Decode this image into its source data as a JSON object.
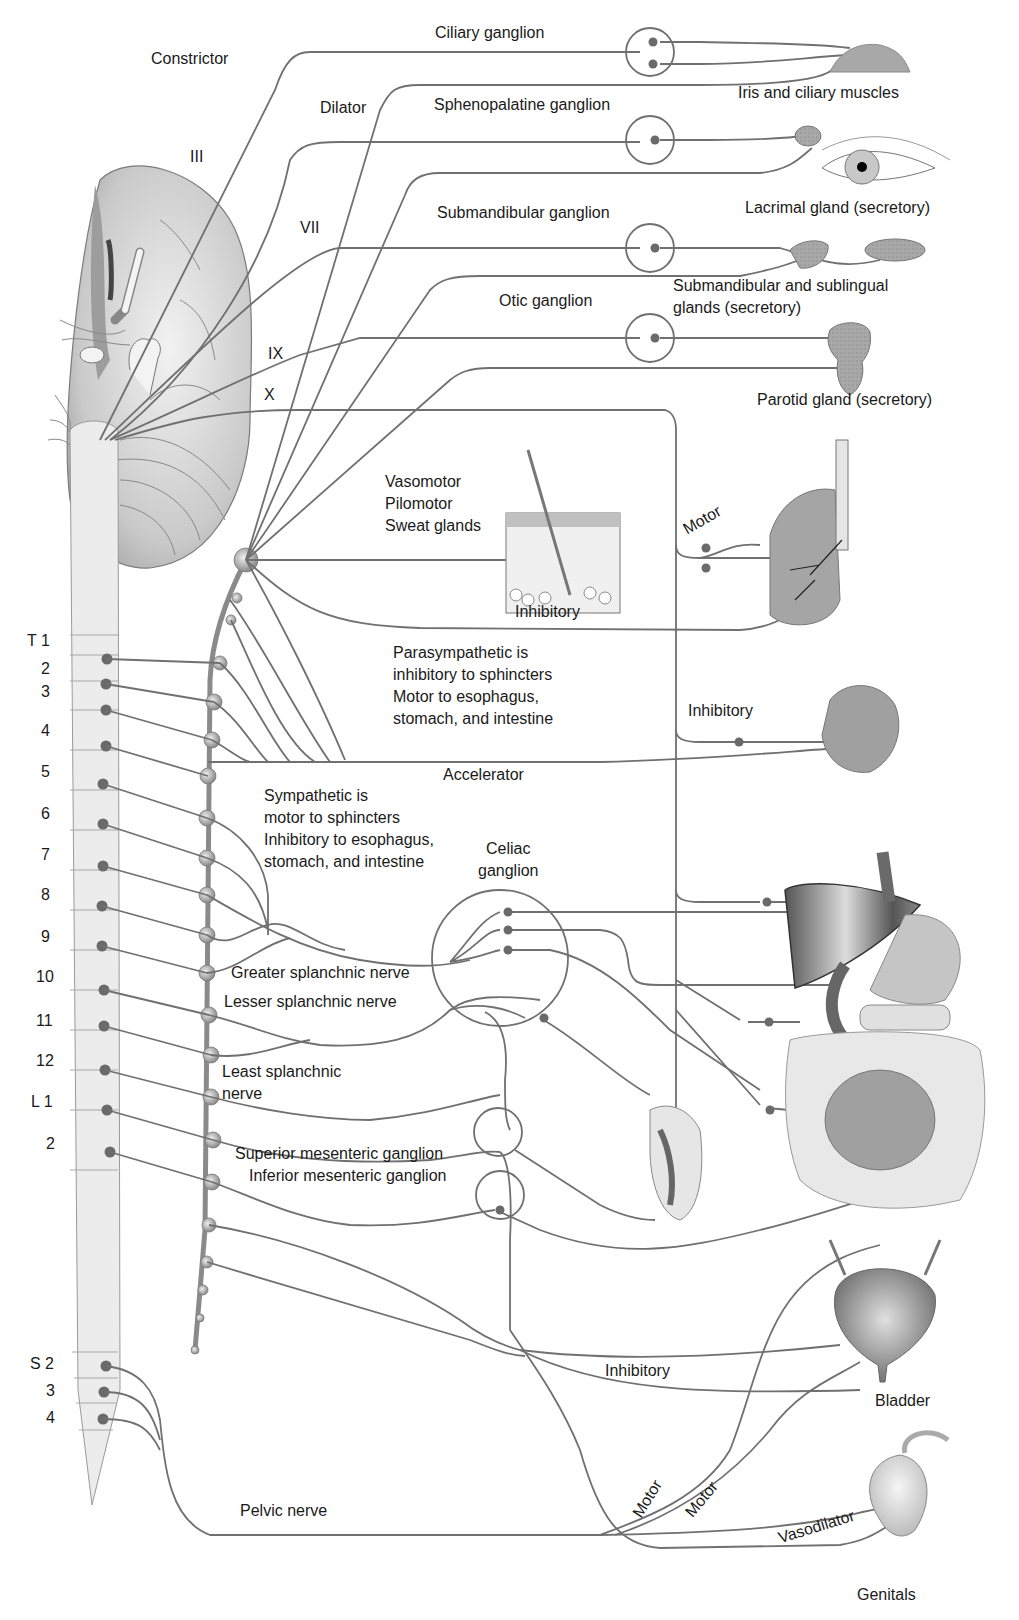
{
  "diagram": {
    "colors": {
      "nerve": "#6e6e6e",
      "ganglion_outline": "#6e6e6e",
      "cell_body": "#666666",
      "cord_fill": "#ececec",
      "organ_fill_light": "#d6d6d6",
      "organ_fill_dark": "#8a8a8a",
      "text": "#1a1a1a"
    },
    "cranial_nerves": [
      "III",
      "VII",
      "IX",
      "X"
    ],
    "ganglia": {
      "ciliary": "Ciliary ganglion",
      "sphenopalatine": "Sphenopalatine ganglion",
      "submandibular": "Submandibular ganglion",
      "otic": "Otic ganglion",
      "celiac": "Celiac\nganglion",
      "superior_mesenteric": "Superior mesenteric ganglion",
      "inferior_mesenteric": "Inferior mesenteric ganglion"
    },
    "targets": {
      "iris": "Iris and ciliary muscles",
      "lacrimal": "Lacrimal gland (secretory)",
      "submandibular_glands": "Submandibular and sublingual\nglands (secretory)",
      "parotid": "Parotid gland (secretory)",
      "bladder": "Bladder",
      "genitals": "Genitals"
    },
    "fiber_labels": {
      "constrictor": "Constrictor",
      "dilator": "Dilator",
      "skin": "Vasomotor\nPilomotor\nSweat glands",
      "motor_lung": "Motor",
      "inhibitory_lung": "Inhibitory",
      "inhibitory_heart": "Inhibitory",
      "accelerator": "Accelerator",
      "greater_splanchnic": "Greater splanchnic nerve",
      "lesser_splanchnic": "Lesser splanchnic nerve",
      "least_splanchnic": "Least splanchnic\n          nerve",
      "inhibitory_bladder": "Inhibitory",
      "motor_1": "Motor",
      "motor_2": "Motor",
      "vasodilator": "Vasodilator",
      "pelvic": "Pelvic nerve"
    },
    "notes": {
      "parasympathetic": "Parasympathetic is\ninhibitory to sphincters\nMotor to esophagus,\nstomach, and intestine",
      "sympathetic": "Sympathetic is\nmotor to sphincters\nInhibitory to esophagus,\nstomach, and intestine"
    },
    "spinal_segments": {
      "thoracic": [
        "T 1",
        "2",
        "3",
        "4",
        "5",
        "6",
        "7",
        "8",
        "9",
        "10",
        "11",
        "12"
      ],
      "lumbar": [
        "L 1",
        "2"
      ],
      "sacral": [
        "S 2",
        "3",
        "4"
      ]
    }
  }
}
